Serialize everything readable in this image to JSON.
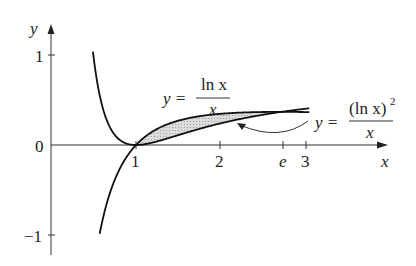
{
  "figure": {
    "axes": {
      "x_label": "x",
      "y_label": "y",
      "x_ticks": [
        "1",
        "2",
        "e",
        "3"
      ],
      "y_ticks": [
        "1",
        "0",
        "−1"
      ]
    },
    "curves": [
      {
        "name": "ln x over x",
        "label_lhs": "y =",
        "numerator": "ln x",
        "denominator": "x"
      },
      {
        "name": "ln x squared over x",
        "label_lhs": "y =",
        "numerator": "(ln x)",
        "superscript": "2",
        "denominator": "x"
      }
    ],
    "shaded_region": "between y = ln x / x and y = (ln x)^2 / x for 1 ≤ x ≤ e"
  },
  "chart_data": {
    "type": "line",
    "title": "",
    "xlabel": "x",
    "ylabel": "y",
    "xlim": [
      0,
      3.8
    ],
    "ylim": [
      -1.1,
      1.3
    ],
    "x_ticks": [
      1,
      2,
      2.718,
      3
    ],
    "x_tick_labels": [
      "1",
      "2",
      "e",
      "3"
    ],
    "y_ticks": [
      -1,
      0,
      1
    ],
    "y_tick_labels": [
      "−1",
      "0",
      "1"
    ],
    "grid": false,
    "series": [
      {
        "name": "y = ln x / x",
        "x": [
          0.57,
          0.7,
          0.85,
          1,
          1.25,
          1.5,
          2,
          2.5,
          2.718,
          3.05
        ],
        "values": [
          -0.99,
          -0.51,
          -0.19,
          0,
          0.18,
          0.27,
          0.35,
          0.37,
          0.37,
          0.37
        ]
      },
      {
        "name": "y = (ln x)^2 / x",
        "x": [
          0.49,
          0.6,
          0.8,
          1,
          1.5,
          2,
          2.5,
          2.718,
          3.05
        ],
        "values": [
          1.04,
          0.44,
          0.06,
          0,
          0.11,
          0.24,
          0.34,
          0.37,
          0.41
        ]
      }
    ],
    "annotations": [
      "shaded region between curves from x = 1 to x = e",
      "arrow pointing from (ln x)^2/x label to lower curve"
    ]
  }
}
